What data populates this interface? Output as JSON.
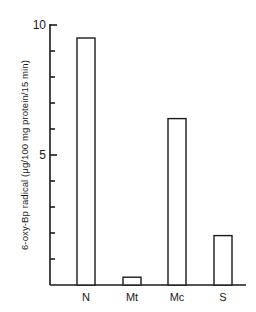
{
  "chart_data": {
    "type": "bar",
    "title": "",
    "xlabel": "",
    "ylabel": "6-oxy-Bp radical (μg/100 mg protein/15 min)",
    "categories": [
      "N",
      "Mt",
      "Mc",
      "S"
    ],
    "values": [
      9.5,
      0.3,
      6.4,
      1.9
    ],
    "ylim": [
      0,
      10
    ],
    "yticks_labeled": [
      5,
      10
    ],
    "yticks_minor_step": 1,
    "grid": false,
    "legend": null
  },
  "axis": {
    "ylabel": "6-oxy-Bp radical (μg/100 mg protein/15 min)",
    "tick_5": "5",
    "tick_10": "10"
  },
  "colors": {
    "stroke": "#1a1a1a",
    "bar_fill": "#ffffff"
  }
}
